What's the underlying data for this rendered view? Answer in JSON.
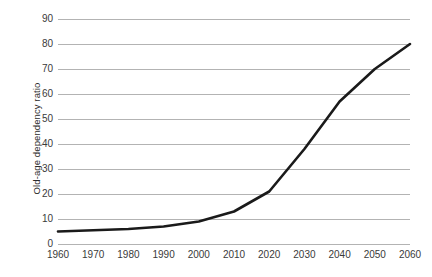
{
  "chart_data": {
    "type": "line",
    "title": "",
    "subtitle": "",
    "xlabel": "",
    "ylabel": "Old-age dependency ratio",
    "categories": [
      1960,
      1970,
      1980,
      1990,
      2000,
      2010,
      2020,
      2030,
      2040,
      2050,
      2060
    ],
    "x_tick_labels": [
      "1960",
      "1970",
      "1980",
      "1990",
      "2000",
      "2010",
      "2020",
      "2030",
      "2040",
      "2050",
      "2060"
    ],
    "y_tick_labels": [
      "0",
      "10",
      "20",
      "30",
      "40",
      "50",
      "60",
      "70",
      "80",
      "90"
    ],
    "y_ticks": [
      0,
      10,
      20,
      30,
      40,
      50,
      60,
      70,
      80,
      90
    ],
    "values": [
      5,
      5.5,
      6,
      7,
      9,
      13,
      21,
      38,
      57,
      70,
      80
    ],
    "series": [
      {
        "name": "Old-age dependency ratio",
        "values": [
          5,
          5.5,
          6,
          7,
          9,
          13,
          21,
          38,
          57,
          70,
          80
        ]
      }
    ],
    "xlim": [
      1960,
      2060
    ],
    "ylim": [
      0,
      90
    ],
    "grid": "horizontal",
    "legend": "none",
    "line_color": "#1a1a1a",
    "gridline_color": "#b3b3b3",
    "tick_label_color": "#3a3a3a",
    "axis_title_color": "#2b2b2b",
    "background_color": "#ffffff"
  }
}
